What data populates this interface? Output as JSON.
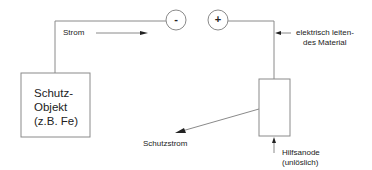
{
  "diagram": {
    "type": "cathodic-protection-impressed-current",
    "labels": {
      "current": "Strom",
      "conductor_line1": "elektrisch leiten-",
      "conductor_line2": "des Material",
      "protected_object_line1": "Schutz-",
      "protected_object_line2": "Objekt",
      "protected_object_line3": "(z.B. Fe)",
      "protection_current": "Schutzstrom",
      "anode_line1": "Hilfsanode",
      "anode_line2": "(unlöslich)"
    },
    "terminals": {
      "negative": "-",
      "positive": "+"
    },
    "colors": {
      "line": "#8a8a8a",
      "arrow": "#222222",
      "text": "#222222",
      "background": "#ffffff"
    }
  }
}
